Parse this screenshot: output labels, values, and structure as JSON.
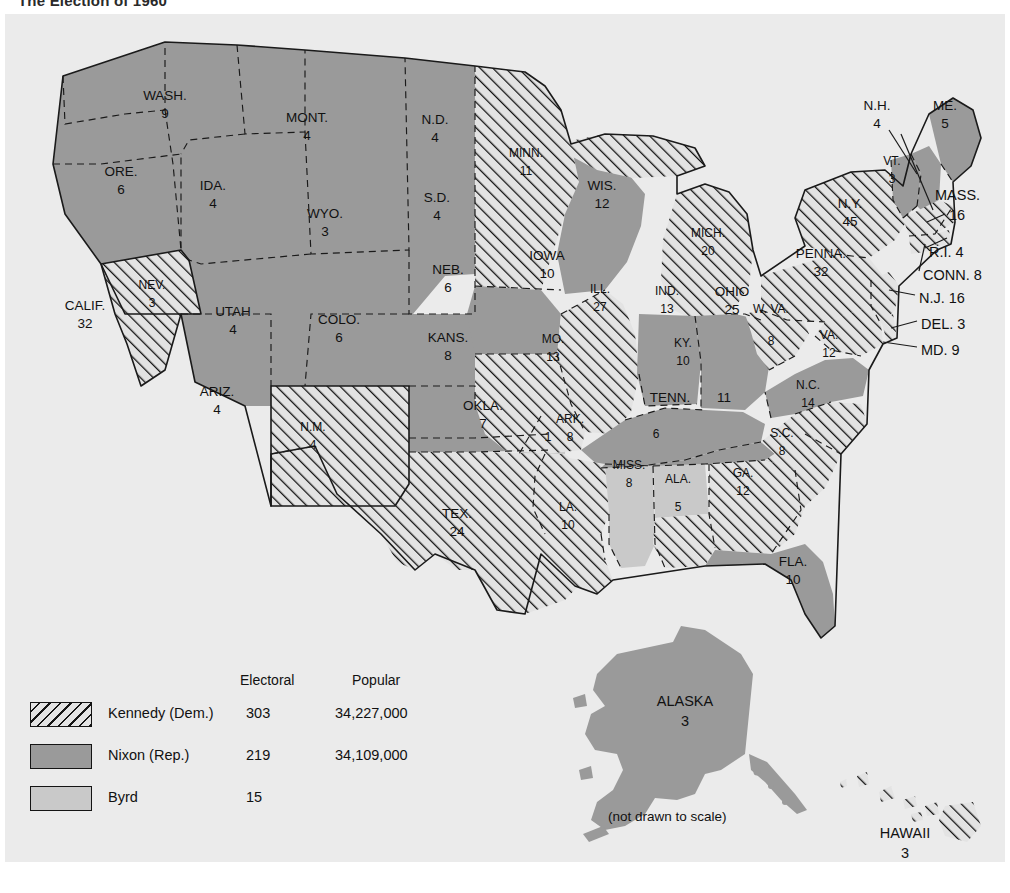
{
  "page": {
    "title": "The Election of 1960"
  },
  "map": {
    "scale_note": "(not drawn to scale)",
    "colors": {
      "kennedy_hatch": "#141414",
      "nixon_gray": "#9a9a9a",
      "byrd_gray": "#c9c9c9",
      "background": "#ebebeb",
      "outline": "#1a1a1a"
    }
  },
  "legend": {
    "col_electoral": "Electoral",
    "col_popular": "Popular",
    "rows": [
      {
        "swatch": "hatched",
        "name": "Kennedy (Dem.)",
        "electoral": "303",
        "popular": "34,227,000"
      },
      {
        "swatch": "solid-gray",
        "name": "Nixon (Rep.)",
        "electoral": "219",
        "popular": "34,109,000"
      },
      {
        "swatch": "light-gray",
        "name": "Byrd",
        "electoral": "15",
        "popular": ""
      }
    ]
  },
  "states": [
    {
      "abbr": "WASH.",
      "votes": "9",
      "winner": "nixon"
    },
    {
      "abbr": "ORE.",
      "votes": "6",
      "winner": "nixon"
    },
    {
      "abbr": "CALIF.",
      "votes": "32",
      "winner": "nixon"
    },
    {
      "abbr": "NEV.",
      "votes": "3",
      "winner": "kennedy"
    },
    {
      "abbr": "IDA.",
      "votes": "4",
      "winner": "nixon"
    },
    {
      "abbr": "MONT.",
      "votes": "4",
      "winner": "nixon"
    },
    {
      "abbr": "WYO.",
      "votes": "3",
      "winner": "nixon"
    },
    {
      "abbr": "UTAH",
      "votes": "4",
      "winner": "nixon"
    },
    {
      "abbr": "ARIZ.",
      "votes": "4",
      "winner": "nixon"
    },
    {
      "abbr": "COLO.",
      "votes": "6",
      "winner": "nixon"
    },
    {
      "abbr": "N.M.",
      "votes": "4",
      "winner": "kennedy"
    },
    {
      "abbr": "N.D.",
      "votes": "4",
      "winner": "nixon"
    },
    {
      "abbr": "S.D.",
      "votes": "4",
      "winner": "nixon"
    },
    {
      "abbr": "NEB.",
      "votes": "6",
      "winner": "nixon"
    },
    {
      "abbr": "KANS.",
      "votes": "8",
      "winner": "nixon"
    },
    {
      "abbr": "OKLA.",
      "votes": "7",
      "winner": "nixon",
      "split_votes": "1",
      "split_winner": "byrd"
    },
    {
      "abbr": "TEX.",
      "votes": "24",
      "winner": "kennedy"
    },
    {
      "abbr": "MINN.",
      "votes": "11",
      "winner": "kennedy"
    },
    {
      "abbr": "IOWA",
      "votes": "10",
      "winner": "nixon"
    },
    {
      "abbr": "MO.",
      "votes": "13",
      "winner": "kennedy"
    },
    {
      "abbr": "ARK.",
      "votes": "8",
      "winner": "kennedy"
    },
    {
      "abbr": "LA.",
      "votes": "10",
      "winner": "kennedy"
    },
    {
      "abbr": "WIS.",
      "votes": "12",
      "winner": "nixon"
    },
    {
      "abbr": "ILL.",
      "votes": "27",
      "winner": "kennedy"
    },
    {
      "abbr": "MISS.",
      "votes": "8",
      "winner": "byrd"
    },
    {
      "abbr": "MICH.",
      "votes": "20",
      "winner": "kennedy"
    },
    {
      "abbr": "IND.",
      "votes": "13",
      "winner": "nixon"
    },
    {
      "abbr": "OHIO",
      "votes": "25",
      "winner": "nixon"
    },
    {
      "abbr": "KY.",
      "votes": "10",
      "winner": "nixon"
    },
    {
      "abbr": "TENN.",
      "votes": "11",
      "winner": "nixon"
    },
    {
      "abbr": "ALA.",
      "votes": "5",
      "winner": "kennedy",
      "split_votes": "6",
      "split_winner": "byrd"
    },
    {
      "abbr": "GA.",
      "votes": "12",
      "winner": "kennedy"
    },
    {
      "abbr": "FLA.",
      "votes": "10",
      "winner": "nixon"
    },
    {
      "abbr": "S.C.",
      "votes": "8",
      "winner": "kennedy"
    },
    {
      "abbr": "N.C.",
      "votes": "14",
      "winner": "kennedy"
    },
    {
      "abbr": "VA.",
      "votes": "12",
      "winner": "nixon"
    },
    {
      "abbr": "W. VA.",
      "votes": "8",
      "winner": "kennedy"
    },
    {
      "abbr": "PENNA.",
      "votes": "32",
      "winner": "kennedy"
    },
    {
      "abbr": "N.Y.",
      "votes": "45",
      "winner": "kennedy"
    },
    {
      "abbr": "VT.",
      "votes": "3",
      "winner": "nixon"
    },
    {
      "abbr": "N.H.",
      "votes": "4",
      "winner": "nixon"
    },
    {
      "abbr": "ME.",
      "votes": "5",
      "winner": "nixon"
    },
    {
      "abbr": "MASS.",
      "votes": "16",
      "winner": "kennedy"
    },
    {
      "abbr": "R.I.",
      "votes": "4",
      "winner": "kennedy"
    },
    {
      "abbr": "CONN.",
      "votes": "8",
      "winner": "kennedy"
    },
    {
      "abbr": "N.J.",
      "votes": "16",
      "winner": "kennedy"
    },
    {
      "abbr": "DEL.",
      "votes": "3",
      "winner": "kennedy"
    },
    {
      "abbr": "MD.",
      "votes": "9",
      "winner": "kennedy"
    },
    {
      "abbr": "ALASKA",
      "votes": "3",
      "winner": "nixon"
    },
    {
      "abbr": "HAWAII",
      "votes": "3",
      "winner": "kennedy"
    }
  ],
  "callout_labels": {
    "mass": "MASS.",
    "mass_v": "16",
    "ri": "R.I. 4",
    "conn": "CONN. 8",
    "nj": "N.J. 16",
    "del": "DEL. 3",
    "md": "MD. 9",
    "nh": "N.H.",
    "nh_v": "4",
    "vt": "VT.",
    "vt_v": "3",
    "me": "ME.",
    "me_v": "5"
  }
}
